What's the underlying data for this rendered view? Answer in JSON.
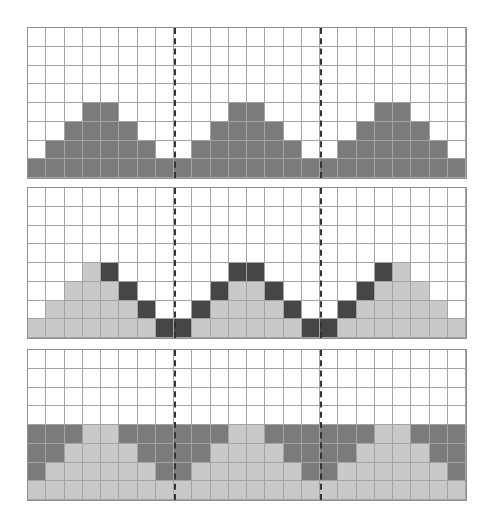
{
  "figure": {
    "columns": 24,
    "rows": 8,
    "period": 8,
    "divider_columns": [
      8,
      16
    ],
    "colors": {
      "empty": "#ffffff",
      "dark": "#7b7b7b",
      "light": "#c9c9c9",
      "darkest": "#464646",
      "grid": "#a4a4a4"
    },
    "panels": [
      {
        "name": "panel-top",
        "top": 27,
        "rows": [
          "000000000000000000000000",
          "000000000000000000000000",
          "000000000000000000000000",
          "000000000000000000000000",
          "000110000001100000011000",
          "001111000011110000111100",
          "011111100111111001111110",
          "111111111111111111111111"
        ]
      },
      {
        "name": "panel-middle",
        "top": 187,
        "rows": [
          "000000000000000000000000",
          "000000000000000000000000",
          "000000000000000000000000",
          "000000000000000000000000",
          "000230000003300000032000",
          "002223000032230000322200",
          "022222300322223003222220",
          "222222233222222332222222"
        ]
      },
      {
        "name": "panel-bottom",
        "top": 349,
        "rows": [
          "000000000000000000000000",
          "000000000000000000000000",
          "000000000000000000000000",
          "000000000000000000000000",
          "111221111112211111122111",
          "112222111122221111222211",
          "122222211222222112222221",
          "222222222222222222222222"
        ]
      }
    ]
  }
}
